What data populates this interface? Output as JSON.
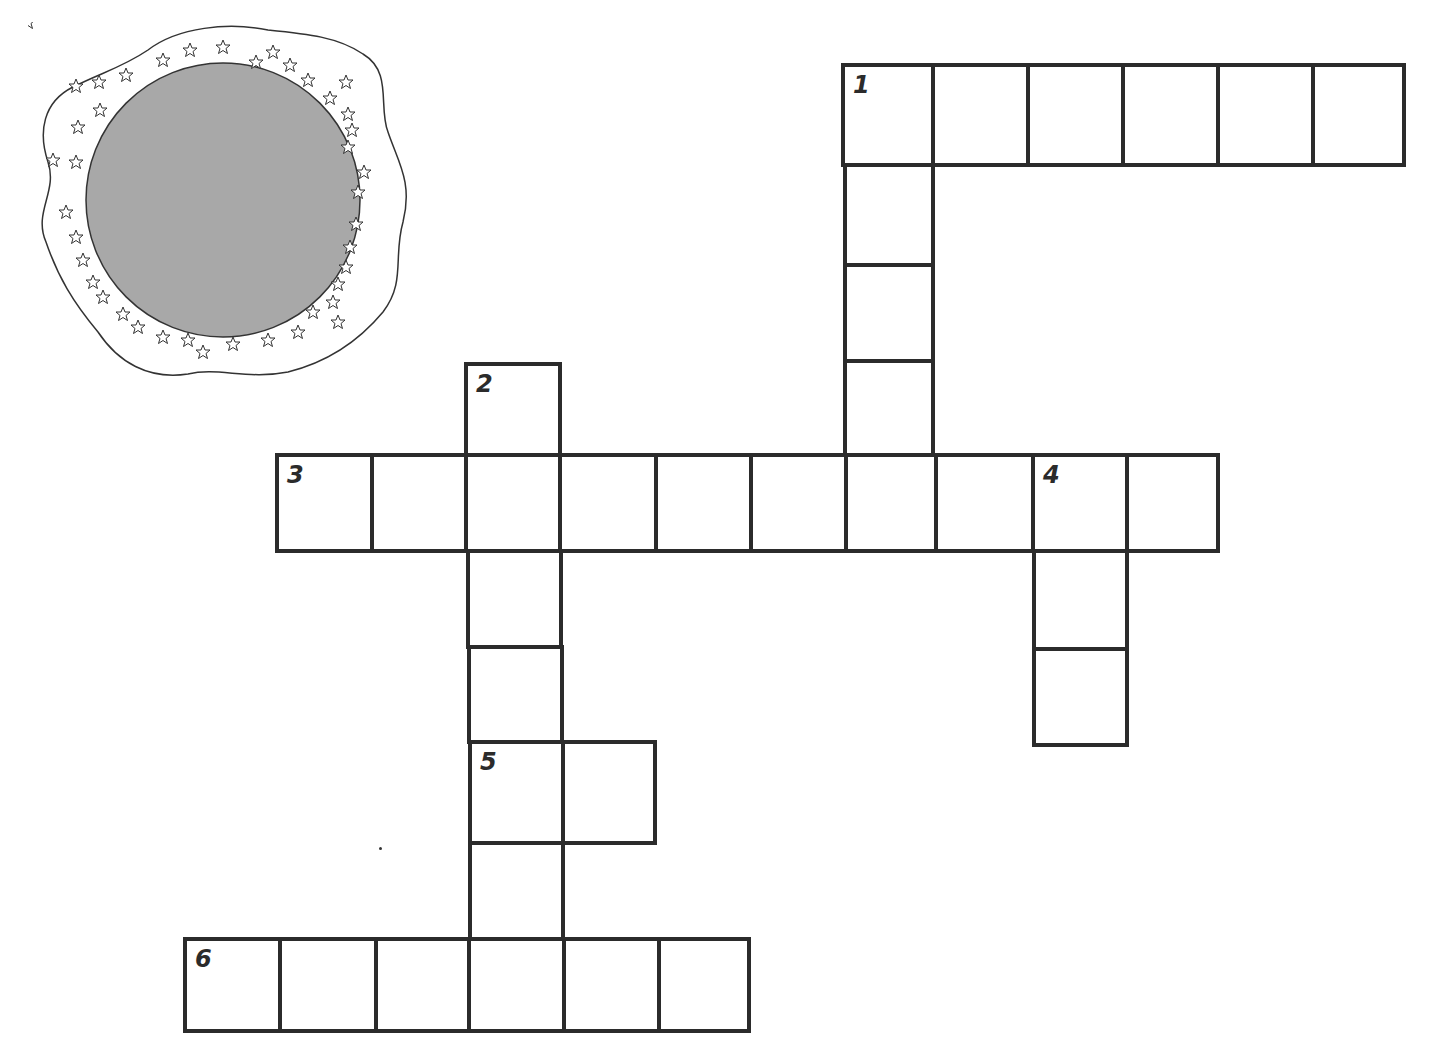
{
  "puzzle": {
    "type": "crossword",
    "decoration": {
      "name": "moon-with-stars",
      "circle_color": "#a8a8a8",
      "outline_color": "#333333"
    },
    "colors": {
      "line": "#2b2b2b",
      "cell_fill": "#ffffff",
      "background": "#ffffff"
    },
    "clue_numbers": [
      "1",
      "2",
      "3",
      "4",
      "5",
      "6"
    ],
    "entries": [
      {
        "number": "1",
        "direction": "across",
        "length": 6
      },
      {
        "number": "1",
        "direction": "down",
        "length": 5
      },
      {
        "number": "2",
        "direction": "down",
        "length": 7
      },
      {
        "number": "3",
        "direction": "across",
        "length": 10
      },
      {
        "number": "4",
        "direction": "down",
        "length": 3
      },
      {
        "number": "5",
        "direction": "across",
        "length": 2
      },
      {
        "number": "6",
        "direction": "across",
        "length": 6
      }
    ]
  }
}
